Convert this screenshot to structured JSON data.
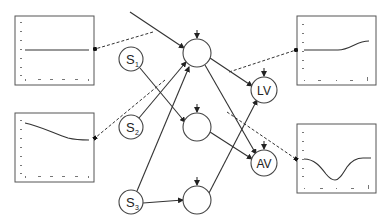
{
  "diagram": {
    "inputs": [
      {
        "id": "s1",
        "label": "S",
        "subscript": "1"
      },
      {
        "id": "s2",
        "label": "S",
        "subscript": "2"
      },
      {
        "id": "s3",
        "label": "S",
        "subscript": "3"
      }
    ],
    "hidden_nodes": [
      {
        "id": "h1",
        "label": ""
      },
      {
        "id": "h2",
        "label": ""
      },
      {
        "id": "h3",
        "label": ""
      }
    ],
    "outputs": [
      {
        "id": "lv",
        "label": "LV"
      },
      {
        "id": "av",
        "label": "AV"
      }
    ],
    "plots": [
      {
        "id": "plot-top-left",
        "shape": "flat",
        "linked_to": "external-input-line"
      },
      {
        "id": "plot-bottom-left",
        "shape": "decreasing",
        "linked_to": "h2-input-edge"
      },
      {
        "id": "plot-top-right",
        "shape": "flat-then-rising",
        "linked_to": "h1-to-lv-edge"
      },
      {
        "id": "plot-bottom-right",
        "shape": "dip",
        "linked_to": "h1-to-av-edge"
      }
    ],
    "edges": [
      [
        "external",
        "h1"
      ],
      [
        "s1",
        "h2"
      ],
      [
        "s2",
        "h1"
      ],
      [
        "s3",
        "h1"
      ],
      [
        "s3",
        "h3"
      ],
      [
        "h1",
        "lv"
      ],
      [
        "h1",
        "av"
      ],
      [
        "h2",
        "av"
      ],
      [
        "h3",
        "lv"
      ]
    ]
  }
}
